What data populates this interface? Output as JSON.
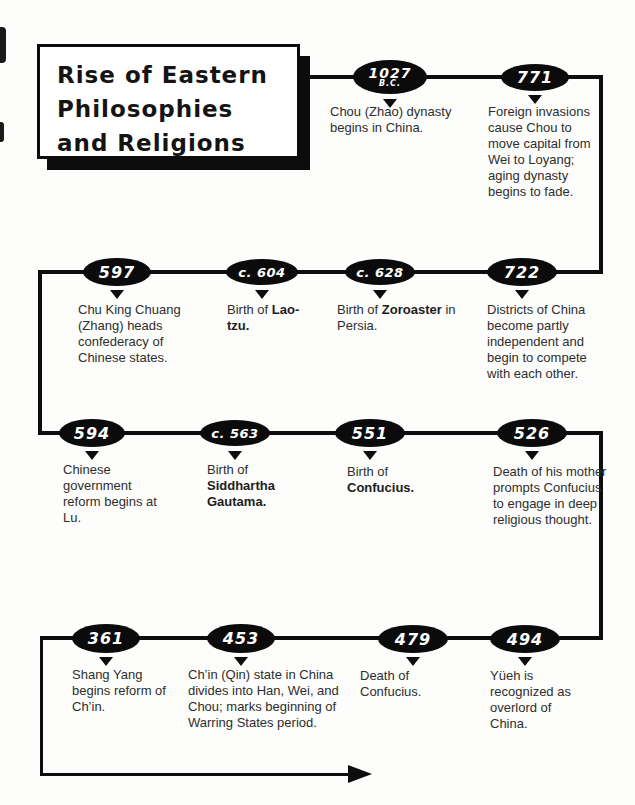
{
  "title": {
    "line1": "Rise of Eastern",
    "line2": "Philosophies",
    "line3": "and Religions"
  },
  "colors": {
    "line": "#0d0d0d",
    "oval_fill": "#0b0b0b",
    "oval_text": "#ffffff",
    "background": "#fdfdfb"
  },
  "events": [
    {
      "date": "1027",
      "date_sub": "B.C.",
      "desc_pre": "Chou (Zhao) dynasty begins in China."
    },
    {
      "date": "771",
      "desc_pre": "Foreign invasions cause Chou to move capital from Wei to Loyang; aging dynasty begins to fade."
    },
    {
      "date": "597",
      "desc_pre": "Chu King Chuang (Zhang) heads confederacy of Chinese states."
    },
    {
      "date": "c. 604",
      "desc_pre": "Birth of ",
      "desc_bold": "Lao-tzu."
    },
    {
      "date": "c. 628",
      "desc_pre": "Birth of ",
      "desc_bold": "Zoroaster",
      "desc_post": " in Persia."
    },
    {
      "date": "722",
      "desc_pre": "Districts of China become partly independent and begin to compete with each other."
    },
    {
      "date": "594",
      "desc_pre": "Chinese government reform begins at Lu."
    },
    {
      "date": "c. 563",
      "desc_pre": "Birth of ",
      "desc_bold": "Siddhartha Gautama."
    },
    {
      "date": "551",
      "desc_pre": "Birth of ",
      "desc_bold": "Confucius."
    },
    {
      "date": "526",
      "desc_pre": "Death of his mother prompts Confucius to engage in deep religious thought."
    },
    {
      "date": "361",
      "desc_pre": "Shang Yang begins reform of Ch’in."
    },
    {
      "date": "453",
      "desc_pre": "Ch’in (Qin) state in China divides into Han, Wei, and Chou; marks beginning of Warring States period."
    },
    {
      "date": "479",
      "desc_pre": "Death of Confucius."
    },
    {
      "date": "494",
      "desc_pre": "Yüeh is recognized as overlord of China."
    }
  ]
}
